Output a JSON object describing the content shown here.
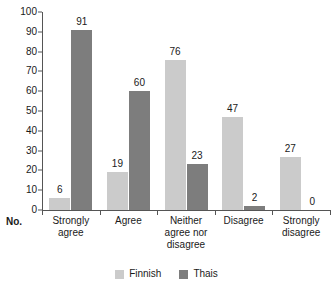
{
  "chart_data": {
    "type": "bar",
    "title": "",
    "xlabel": "No.",
    "ylabel": "",
    "ylim": [
      0,
      100
    ],
    "ytick_step": 10,
    "grid": false,
    "legend_position": "bottom-center",
    "categories": [
      "Strongly agree",
      "Agree",
      "Neither agree nor disagree",
      "Disagree",
      "Strongly disagree"
    ],
    "category_lines": [
      [
        "Strongly",
        "agree"
      ],
      [
        "Agree"
      ],
      [
        "Neither",
        "agree nor",
        "disagree"
      ],
      [
        "Disagree"
      ],
      [
        "Strongly",
        "disagree"
      ]
    ],
    "series": [
      {
        "name": "Finnish",
        "color": "#cbcbcb",
        "values": [
          6,
          19,
          76,
          47,
          27
        ]
      },
      {
        "name": "Thais",
        "color": "#7d7d7d",
        "values": [
          91,
          60,
          23,
          2,
          0
        ]
      }
    ],
    "ytick_labels": [
      "0",
      "10",
      "20",
      "30",
      "40",
      "50",
      "60",
      "70",
      "80",
      "90",
      "100"
    ]
  },
  "axis": {
    "corner_label": "No.",
    "y_ticks": [
      {
        "value": 100,
        "label": "100"
      },
      {
        "value": 90,
        "label": "90"
      },
      {
        "value": 80,
        "label": "80"
      },
      {
        "value": 70,
        "label": "70"
      },
      {
        "value": 60,
        "label": "60"
      },
      {
        "value": 50,
        "label": "50"
      },
      {
        "value": 40,
        "label": "40"
      },
      {
        "value": 30,
        "label": "30"
      },
      {
        "value": 20,
        "label": "20"
      },
      {
        "value": 10,
        "label": "10"
      },
      {
        "value": 0,
        "label": "0"
      }
    ]
  },
  "legend": {
    "items": [
      {
        "label": "Finnish",
        "color": "#cbcbcb"
      },
      {
        "label": "Thais",
        "color": "#7d7d7d"
      }
    ]
  }
}
